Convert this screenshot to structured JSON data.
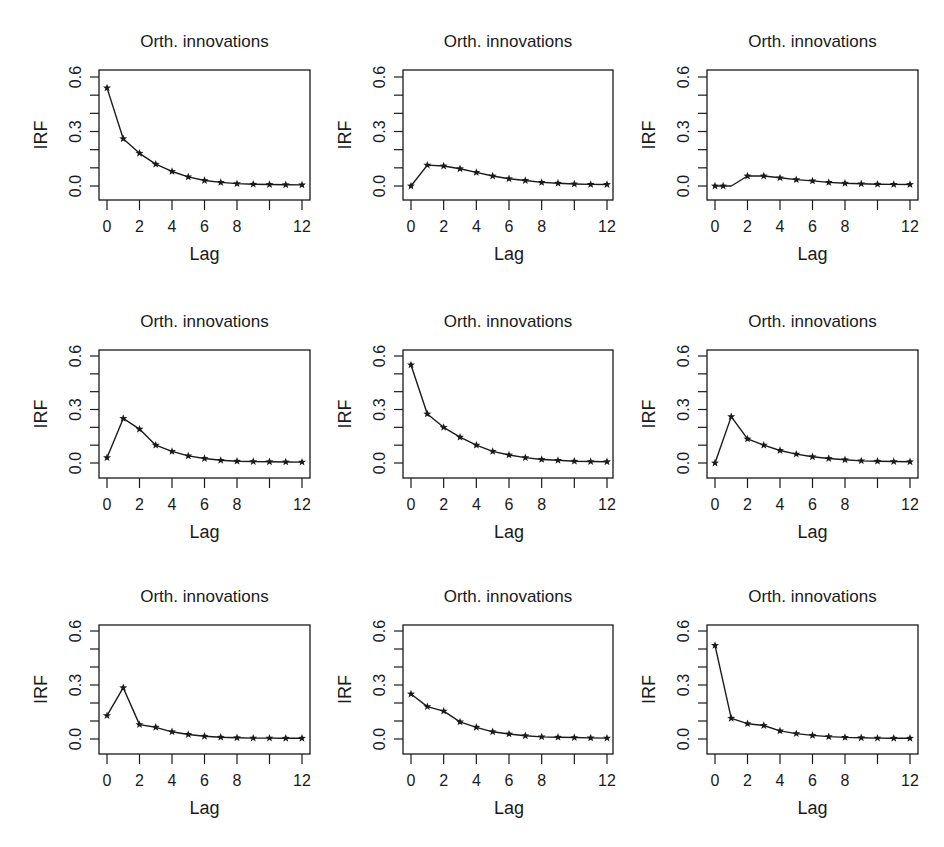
{
  "figure": {
    "rows": 3,
    "cols": 3,
    "line_color": "#1a1a1a",
    "background": "#ffffff"
  },
  "chart_data": [
    {
      "type": "line",
      "title": "Orth. innovations",
      "xlabel": "Lag",
      "ylabel": "IRF",
      "x": [
        0,
        1,
        2,
        3,
        4,
        5,
        6,
        7,
        8,
        9,
        10,
        11,
        12
      ],
      "values": [
        0.54,
        0.26,
        0.18,
        0.12,
        0.08,
        0.05,
        0.03,
        0.02,
        0.013,
        0.01,
        0.008,
        0.007,
        0.006
      ],
      "ylim": [
        -0.08,
        0.65
      ],
      "xlim": [
        -0.5,
        12.5
      ],
      "yticks": [
        0.0,
        0.1,
        0.2,
        0.3,
        0.4,
        0.5,
        0.6
      ],
      "ytick_labels": [
        "0.0",
        "",
        "",
        "0.3",
        "",
        "",
        "0.6"
      ],
      "xticks": [
        0,
        2,
        4,
        6,
        8,
        10,
        12
      ],
      "xtick_labels": [
        "0",
        "2",
        "4",
        "6",
        "8",
        "",
        "12"
      ],
      "marker": "star",
      "grid": false,
      "legend": null
    },
    {
      "type": "line",
      "title": "Orth. innovations",
      "xlabel": "Lag",
      "ylabel": "IRF",
      "x": [
        0,
        1,
        2,
        3,
        4,
        5,
        6,
        7,
        8,
        9,
        10,
        11,
        12
      ],
      "values": [
        0.0,
        0.115,
        0.11,
        0.095,
        0.075,
        0.055,
        0.04,
        0.03,
        0.02,
        0.015,
        0.011,
        0.009,
        0.008
      ],
      "ylim": [
        -0.08,
        0.65
      ],
      "xlim": [
        -0.5,
        12.5
      ],
      "yticks": [
        0.0,
        0.1,
        0.2,
        0.3,
        0.4,
        0.5,
        0.6
      ],
      "ytick_labels": [
        "0.0",
        "",
        "",
        "0.3",
        "",
        "",
        "0.6"
      ],
      "xticks": [
        0,
        2,
        4,
        6,
        8,
        10,
        12
      ],
      "xtick_labels": [
        "0",
        "2",
        "4",
        "6",
        "8",
        "",
        "12"
      ],
      "marker": "star",
      "grid": false,
      "legend": null
    },
    {
      "type": "line",
      "title": "Orth. innovations",
      "xlabel": "Lag",
      "ylabel": "IRF",
      "x": [
        0,
        0.5,
        1,
        2,
        3,
        4,
        5,
        6,
        7,
        8,
        9,
        10,
        11,
        12
      ],
      "values": [
        0.0,
        0.0,
        0.0,
        0.055,
        0.055,
        0.045,
        0.035,
        0.028,
        0.02,
        0.015,
        0.012,
        0.01,
        0.009,
        0.008
      ],
      "marker_x": [
        0,
        0.5,
        2,
        3,
        4,
        5,
        6,
        7,
        8,
        9,
        10,
        11,
        12
      ],
      "ylim": [
        -0.08,
        0.65
      ],
      "xlim": [
        -0.5,
        12.5
      ],
      "yticks": [
        0.0,
        0.1,
        0.2,
        0.3,
        0.4,
        0.5,
        0.6
      ],
      "ytick_labels": [
        "0.0",
        "",
        "",
        "0.3",
        "",
        "",
        "0.6"
      ],
      "xticks": [
        0,
        2,
        4,
        6,
        8,
        10,
        12
      ],
      "xtick_labels": [
        "0",
        "2",
        "4",
        "6",
        "8",
        "",
        "12"
      ],
      "marker": "star",
      "grid": false,
      "legend": null
    },
    {
      "type": "line",
      "title": "Orth. innovations",
      "xlabel": "Lag",
      "ylabel": "IRF",
      "x": [
        0,
        1,
        2,
        3,
        4,
        5,
        6,
        7,
        8,
        9,
        10,
        11,
        12
      ],
      "values": [
        0.03,
        0.25,
        0.19,
        0.1,
        0.065,
        0.04,
        0.025,
        0.015,
        0.01,
        0.008,
        0.007,
        0.006,
        0.005
      ],
      "ylim": [
        -0.08,
        0.65
      ],
      "xlim": [
        -0.5,
        12.5
      ],
      "yticks": [
        0.0,
        0.1,
        0.2,
        0.3,
        0.4,
        0.5,
        0.6
      ],
      "ytick_labels": [
        "0.0",
        "",
        "",
        "0.3",
        "",
        "",
        "0.6"
      ],
      "xticks": [
        0,
        2,
        4,
        6,
        8,
        10,
        12
      ],
      "xtick_labels": [
        "0",
        "2",
        "4",
        "6",
        "8",
        "",
        "12"
      ],
      "marker": "star",
      "grid": false,
      "legend": null
    },
    {
      "type": "line",
      "title": "Orth. innovations",
      "xlabel": "Lag",
      "ylabel": "IRF",
      "x": [
        0,
        1,
        2,
        3,
        4,
        5,
        6,
        7,
        8,
        9,
        10,
        11,
        12
      ],
      "values": [
        0.55,
        0.275,
        0.2,
        0.145,
        0.1,
        0.065,
        0.045,
        0.03,
        0.02,
        0.015,
        0.01,
        0.008,
        0.007
      ],
      "ylim": [
        -0.08,
        0.65
      ],
      "xlim": [
        -0.5,
        12.5
      ],
      "yticks": [
        0.0,
        0.1,
        0.2,
        0.3,
        0.4,
        0.5,
        0.6
      ],
      "ytick_labels": [
        "0.0",
        "",
        "",
        "0.3",
        "",
        "",
        "0.6"
      ],
      "xticks": [
        0,
        2,
        4,
        6,
        8,
        10,
        12
      ],
      "xtick_labels": [
        "0",
        "2",
        "4",
        "6",
        "8",
        "",
        "12"
      ],
      "marker": "star",
      "grid": false,
      "legend": null
    },
    {
      "type": "line",
      "title": "Orth. innovations",
      "xlabel": "Lag",
      "ylabel": "IRF",
      "x": [
        0,
        1,
        2,
        3,
        4,
        5,
        6,
        7,
        8,
        9,
        10,
        11,
        12
      ],
      "values": [
        0.0,
        0.26,
        0.135,
        0.1,
        0.07,
        0.05,
        0.035,
        0.025,
        0.018,
        0.012,
        0.01,
        0.008,
        0.007
      ],
      "ylim": [
        -0.08,
        0.65
      ],
      "xlim": [
        -0.5,
        12.5
      ],
      "yticks": [
        0.0,
        0.1,
        0.2,
        0.3,
        0.4,
        0.5,
        0.6
      ],
      "ytick_labels": [
        "0.0",
        "",
        "",
        "0.3",
        "",
        "",
        "0.6"
      ],
      "xticks": [
        0,
        2,
        4,
        6,
        8,
        10,
        12
      ],
      "xtick_labels": [
        "0",
        "2",
        "4",
        "6",
        "8",
        "",
        "12"
      ],
      "marker": "star",
      "grid": false,
      "legend": null
    },
    {
      "type": "line",
      "title": "Orth. innovations",
      "xlabel": "Lag",
      "ylabel": "IRF",
      "x": [
        0,
        1,
        2,
        3,
        4,
        5,
        6,
        7,
        8,
        9,
        10,
        11,
        12
      ],
      "values": [
        0.13,
        0.285,
        0.08,
        0.065,
        0.04,
        0.025,
        0.015,
        0.01,
        0.007,
        0.005,
        0.005,
        0.004,
        0.004
      ],
      "ylim": [
        -0.08,
        0.65
      ],
      "xlim": [
        -0.5,
        12.5
      ],
      "yticks": [
        0.0,
        0.1,
        0.2,
        0.3,
        0.4,
        0.5,
        0.6
      ],
      "ytick_labels": [
        "0.0",
        "",
        "",
        "0.3",
        "",
        "",
        "0.6"
      ],
      "xticks": [
        0,
        2,
        4,
        6,
        8,
        10,
        12
      ],
      "xtick_labels": [
        "0",
        "2",
        "4",
        "6",
        "8",
        "",
        "12"
      ],
      "marker": "star",
      "grid": false,
      "legend": null
    },
    {
      "type": "line",
      "title": "Orth. innovations",
      "xlabel": "Lag",
      "ylabel": "IRF",
      "x": [
        0,
        1,
        2,
        3,
        4,
        5,
        6,
        7,
        8,
        9,
        10,
        11,
        12
      ],
      "values": [
        0.25,
        0.18,
        0.155,
        0.095,
        0.065,
        0.04,
        0.028,
        0.018,
        0.012,
        0.01,
        0.008,
        0.006,
        0.005
      ],
      "ylim": [
        -0.08,
        0.65
      ],
      "xlim": [
        -0.5,
        12.5
      ],
      "yticks": [
        0.0,
        0.1,
        0.2,
        0.3,
        0.4,
        0.5,
        0.6
      ],
      "ytick_labels": [
        "0.0",
        "",
        "",
        "0.3",
        "",
        "",
        "0.6"
      ],
      "xticks": [
        0,
        2,
        4,
        6,
        8,
        10,
        12
      ],
      "xtick_labels": [
        "0",
        "2",
        "4",
        "6",
        "8",
        "",
        "12"
      ],
      "marker": "star",
      "grid": false,
      "legend": null
    },
    {
      "type": "line",
      "title": "Orth. innovations",
      "xlabel": "Lag",
      "ylabel": "IRF",
      "x": [
        0,
        1,
        2,
        3,
        4,
        5,
        6,
        7,
        8,
        9,
        10,
        11,
        12
      ],
      "values": [
        0.52,
        0.115,
        0.085,
        0.075,
        0.045,
        0.03,
        0.02,
        0.013,
        0.009,
        0.007,
        0.005,
        0.004,
        0.004
      ],
      "ylim": [
        -0.08,
        0.65
      ],
      "xlim": [
        -0.5,
        12.5
      ],
      "yticks": [
        0.0,
        0.1,
        0.2,
        0.3,
        0.4,
        0.5,
        0.6
      ],
      "ytick_labels": [
        "0.0",
        "",
        "",
        "0.3",
        "",
        "",
        "0.6"
      ],
      "xticks": [
        0,
        2,
        4,
        6,
        8,
        10,
        12
      ],
      "xtick_labels": [
        "0",
        "2",
        "4",
        "6",
        "8",
        "",
        "12"
      ],
      "marker": "star",
      "grid": false,
      "legend": null
    }
  ]
}
